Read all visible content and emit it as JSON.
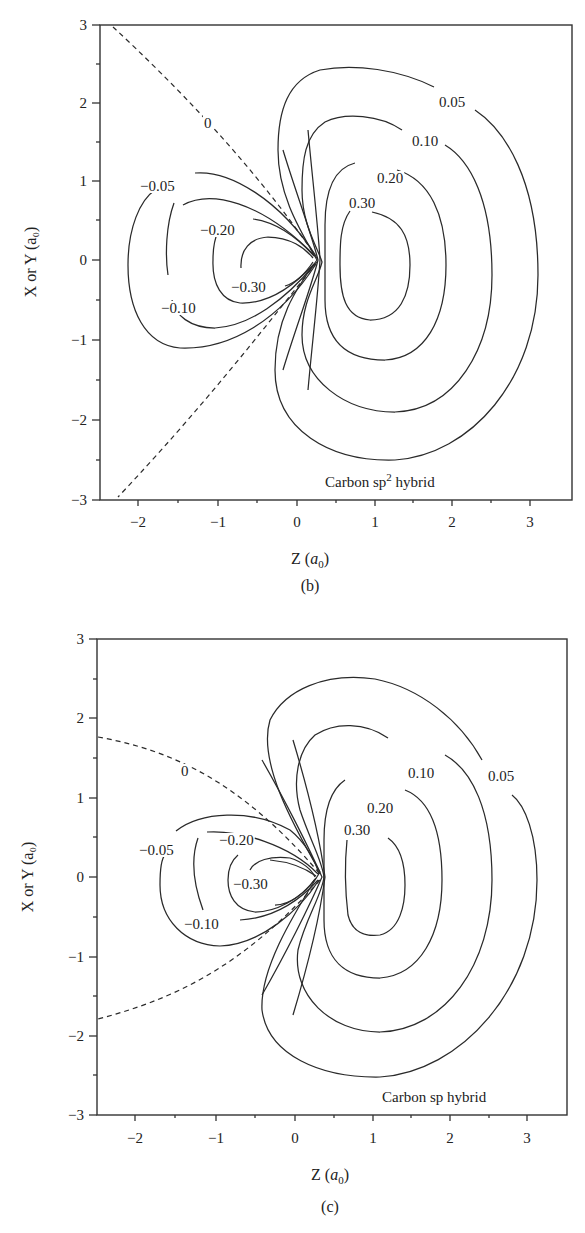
{
  "chart_data": [
    {
      "type": "contour",
      "panel": "(b)",
      "title": "Carbon sp2 hybrid",
      "annotation": "Carbon sp² hybrid",
      "xlabel": "Z (a0)",
      "ylabel": "X or Y (a0)",
      "xlim": [
        -2.5,
        3.5
      ],
      "ylim": [
        -3,
        3
      ],
      "xticks": [
        -2,
        -1,
        0,
        1,
        2,
        3
      ],
      "yticks": [
        -3,
        -2,
        -1,
        0,
        1,
        2,
        3
      ],
      "grid": false,
      "nucleus_z": 0.25,
      "contour_levels": [
        -0.3,
        -0.2,
        -0.1,
        -0.05,
        0,
        0.05,
        0.1,
        0.2,
        0.3
      ],
      "contours": [
        {
          "level": 0.3,
          "z_range": [
            0.35,
            1.4
          ],
          "xy_range": [
            -0.8,
            0.65
          ]
        },
        {
          "level": 0.2,
          "z_range": [
            0.1,
            1.9
          ],
          "xy_range": [
            -1.3,
            1.25
          ]
        },
        {
          "level": 0.1,
          "z_range": [
            0.0,
            2.5
          ],
          "xy_range": [
            -1.95,
            1.9
          ]
        },
        {
          "level": 0.05,
          "z_range": [
            -0.2,
            3.1
          ],
          "xy_range": [
            -2.55,
            2.5
          ]
        },
        {
          "level": 0,
          "style": "dashed",
          "description": "nodal cone through nucleus, opening angle ~120 deg"
        },
        {
          "level": -0.05,
          "z_range": [
            -1.9,
            0.25
          ],
          "xy_range": [
            -1.15,
            1.1
          ]
        },
        {
          "level": -0.1,
          "z_range": [
            -1.4,
            0.25
          ],
          "xy_range": [
            -0.85,
            0.85
          ]
        },
        {
          "level": -0.2,
          "z_range": [
            -0.8,
            0.25
          ],
          "xy_range": [
            -0.55,
            0.5
          ]
        },
        {
          "level": -0.3,
          "z_range": [
            -0.4,
            0.25
          ],
          "xy_range": [
            -0.3,
            0.3
          ]
        }
      ]
    },
    {
      "type": "contour",
      "panel": "(c)",
      "title": "Carbon sp hybrid",
      "annotation": "Carbon sp hybrid",
      "xlabel": "Z (a0)",
      "ylabel": "X or Y (a0)",
      "xlim": [
        -2.5,
        3.5
      ],
      "ylim": [
        -3,
        3
      ],
      "xticks": [
        -2,
        -1,
        0,
        1,
        2,
        3
      ],
      "yticks": [
        -3,
        -2,
        -1,
        0,
        1,
        2,
        3
      ],
      "grid": false,
      "nucleus_z": 0.3,
      "contour_levels": [
        -0.3,
        -0.2,
        -0.1,
        -0.05,
        0,
        0.05,
        0.1,
        0.2,
        0.3
      ],
      "contours": [
        {
          "level": 0.3,
          "z_range": [
            0.6,
            1.4
          ],
          "xy_range": [
            -0.7,
            0.5
          ]
        },
        {
          "level": 0.2,
          "z_range": [
            0.35,
            1.85
          ],
          "xy_range": [
            -1.3,
            1.2
          ]
        },
        {
          "level": 0.1,
          "z_range": [
            -0.05,
            2.5
          ],
          "xy_range": [
            -1.95,
            1.95
          ]
        },
        {
          "level": 0.05,
          "z_range": [
            -0.5,
            3.1
          ],
          "xy_range": [
            -2.55,
            2.5
          ]
        },
        {
          "level": 0,
          "style": "dashed",
          "description": "nodal surface meeting Z=-2.5 at X=+/-1.8"
        },
        {
          "level": -0.05,
          "z_range": [
            -1.7,
            0.3
          ],
          "xy_range": [
            -0.85,
            0.85
          ]
        },
        {
          "level": -0.1,
          "z_range": [
            -1.3,
            0.3
          ],
          "xy_range": [
            -0.55,
            0.6
          ]
        },
        {
          "level": -0.2,
          "z_range": [
            -0.85,
            0.3
          ],
          "xy_range": [
            -0.45,
            0.35
          ]
        },
        {
          "level": -0.3,
          "z_range": [
            -0.6,
            0.3
          ],
          "xy_range": [
            -0.35,
            0.28
          ]
        }
      ]
    }
  ],
  "panels": {
    "b": {
      "caption": "(b)",
      "annotation": "Carbon sp",
      "annotation_sup": "2",
      "annotation_tail": " hybrid",
      "xlabel_main": "Z (",
      "xlabel_unit": "a",
      "xlabel_sub": "0",
      "xlabel_close": ")",
      "ylabel": "X or Y (a₀)",
      "xticks": [
        "−2",
        "−1",
        "0",
        "1",
        "2",
        "3"
      ],
      "yticks": [
        "3",
        "2",
        "1",
        "0",
        "−1",
        "−2",
        "−3"
      ],
      "levels": {
        "pos05": "0.05",
        "pos10": "0.10",
        "pos20": "0.20",
        "pos30": "0.30",
        "zero": "0",
        "neg05": "−0.05",
        "neg10": "−0.10",
        "neg20": "−0.20",
        "neg30": "−0.30"
      }
    },
    "c": {
      "caption": "(c)",
      "annotation": "Carbon sp hybrid",
      "xlabel_main": "Z (",
      "xlabel_unit": "a",
      "xlabel_sub": "0",
      "xlabel_close": ")",
      "ylabel": "X or Y (a₀)",
      "xticks": [
        "−2",
        "−1",
        "0",
        "1",
        "2",
        "3"
      ],
      "yticks": [
        "3",
        "2",
        "1",
        "0",
        "−1",
        "−2",
        "−3"
      ],
      "levels": {
        "pos05": "0.05",
        "pos10": "0.10",
        "pos20": "0.20",
        "pos30": "0.30",
        "zero": "0",
        "neg05": "−0.05",
        "neg10": "−0.10",
        "neg20": "−0.20",
        "neg30": "−0.30"
      }
    }
  }
}
